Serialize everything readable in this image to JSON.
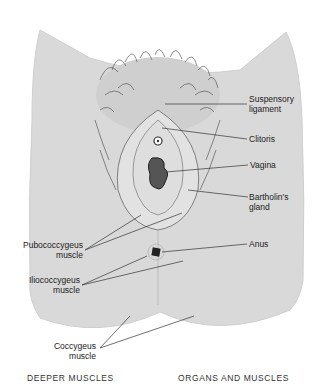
{
  "figure": {
    "labels_right": [
      {
        "id": "suspensory-ligament",
        "line1": "Suspensory",
        "line2": "ligament"
      },
      {
        "id": "clitoris",
        "line1": "Clitoris",
        "line2": ""
      },
      {
        "id": "vagina",
        "line1": "Vagina",
        "line2": ""
      },
      {
        "id": "bartholins-gland",
        "line1": "Bartholin's",
        "line2": "gland"
      },
      {
        "id": "anus",
        "line1": "Anus",
        "line2": ""
      }
    ],
    "labels_left": [
      {
        "id": "pubococcygeus-muscle",
        "line1": "Pubococcygeus",
        "line2": "muscle"
      },
      {
        "id": "iliococcygeus-muscle",
        "line1": "Iliococcygeus",
        "line2": "muscle"
      },
      {
        "id": "coccygeus-muscle",
        "line1": "Coccygeus",
        "line2": "muscle"
      }
    ],
    "captions": {
      "left": "DEEPER MUSCLES",
      "right": "ORGANS AND MUSCLES"
    },
    "colors": {
      "skin": "#d9d9d9",
      "line": "#333333",
      "hair": "#444444"
    }
  }
}
